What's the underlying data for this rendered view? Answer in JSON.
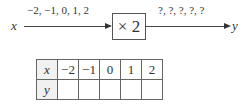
{
  "diagram": {
    "input_var": "x",
    "input_values": "−2, −1, 0, 1, 2",
    "operation": "× 2",
    "output_values": "?, ?, ?, ?, ?",
    "output_var": "y"
  },
  "table": {
    "rows": [
      {
        "header": "x",
        "cells": [
          "−2",
          "−1",
          "0",
          "1",
          "2"
        ]
      },
      {
        "header": "y",
        "cells": [
          "",
          "",
          "",
          "",
          ""
        ]
      }
    ]
  }
}
